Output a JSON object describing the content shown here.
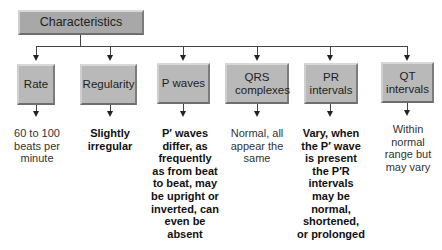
{
  "root": {
    "label": "Characteristics"
  },
  "categories": [
    {
      "label": "Rate",
      "description": "60 to 100 beats per minute",
      "bold": false
    },
    {
      "label": "Regularity",
      "description": "Slightly irregular",
      "bold": true
    },
    {
      "label": "P waves",
      "description": "P′ waves differ, as frequently as from beat to beat, may be upright or inverted, can even be absent",
      "bold": true
    },
    {
      "label": "QRS complexes",
      "description": "Normal, all appear the same",
      "bold": false
    },
    {
      "label": "PR intervals",
      "description": "Vary, when the P′ wave is present the P′R intervals may be normal, shortened, or prolonged",
      "bold": true
    },
    {
      "label": "QT intervals",
      "description": "Within normal range but may vary",
      "bold": false
    }
  ],
  "colors": {
    "box_fill": "#b9b9b9",
    "root_fill": "#a8a8a8",
    "connector": "#444444"
  }
}
